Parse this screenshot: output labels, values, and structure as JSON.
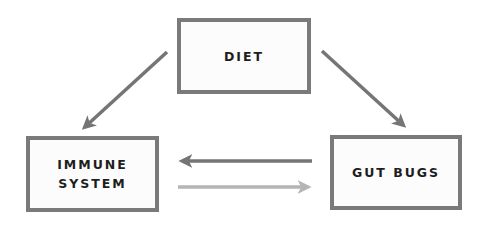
{
  "diagram": {
    "nodes": [
      {
        "id": "diet",
        "label": "DIET"
      },
      {
        "id": "immune",
        "label": "IMMUNE\nSYSTEM"
      },
      {
        "id": "gut",
        "label": "GUT BUGS"
      }
    ],
    "edges": [
      {
        "from": "diet",
        "to": "immune",
        "color": "#757575"
      },
      {
        "from": "diet",
        "to": "gut",
        "color": "#757575"
      },
      {
        "from": "gut",
        "to": "immune",
        "color": "#757575"
      },
      {
        "from": "immune",
        "to": "gut",
        "color": "#b5b5b5"
      }
    ],
    "colors": {
      "border": "#7a7a7a",
      "dark_arrow": "#757575",
      "light_arrow": "#b5b5b5",
      "text": "#1e1e1e"
    }
  }
}
